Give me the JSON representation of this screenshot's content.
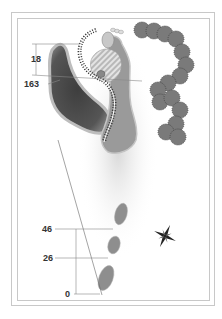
{
  "hole": {
    "distance_markers": [
      {
        "id": "top-18",
        "label": "18"
      },
      {
        "id": "top-163",
        "label": "163"
      },
      {
        "id": "tee-46",
        "label": "46"
      },
      {
        "id": "tee-26",
        "label": "26"
      },
      {
        "id": "tee-0",
        "label": "0"
      }
    ],
    "features": [
      "green",
      "fairway",
      "water-hazard",
      "bunker",
      "trees",
      "tee-boxes",
      "compass-rose"
    ]
  },
  "colors": {
    "water": "#4a4a4a",
    "fairway": "#9a9a9a",
    "tee": "#8e8e8e",
    "trees": "#7a7a7a",
    "frame": "#c8c8c8",
    "text": "#333333"
  }
}
